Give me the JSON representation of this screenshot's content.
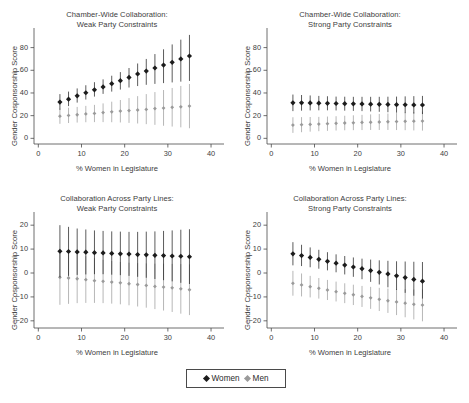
{
  "figure": {
    "background": "#ffffff",
    "width": 469,
    "height": 403
  },
  "legend": {
    "entries": [
      {
        "label": "Women",
        "marker": "diamond-marker",
        "color": "#1c1c1c"
      },
      {
        "label": "Men",
        "marker": "diamond-marker",
        "color": "#9a9a9a"
      }
    ]
  },
  "chart_data": [
    {
      "id": "chamber-wide-weak",
      "type": "scatter",
      "title": "Chamber-Wide Collaboration:\nWeak Party Constraints",
      "xlabel": "% Women in Legislature",
      "ylabel": "Gender Cosponsorship Score",
      "xlim": [
        -1,
        43
      ],
      "ylim": [
        -5,
        92
      ],
      "xticks": [
        0,
        10,
        20,
        30,
        40
      ],
      "yticks": [
        0,
        20,
        40,
        60,
        80
      ],
      "grid": false,
      "legend_position": "bottom-figure",
      "x": [
        5,
        7,
        9,
        11,
        13,
        15,
        17,
        19,
        21,
        23,
        25,
        27,
        29,
        31,
        33,
        35
      ],
      "series": [
        {
          "name": "Women",
          "color": "#1c1c1c",
          "marker": "diamond",
          "values": [
            32.0,
            34.5,
            37.5,
            40.2,
            42.8,
            45.3,
            48.2,
            50.8,
            53.7,
            56.8,
            59.3,
            62.0,
            64.6,
            67.0,
            70.0,
            72.6
          ],
          "ci_low": [
            25.2,
            28.4,
            31.5,
            34.2,
            36.8,
            39.2,
            41.2,
            43.0,
            44.8,
            46.1,
            47.2,
            48.0,
            48.7,
            49.3,
            50.0,
            50.6
          ],
          "ci_high": [
            39.0,
            41.2,
            44.0,
            46.8,
            49.5,
            52.0,
            55.2,
            58.4,
            62.0,
            66.0,
            70.0,
            74.3,
            78.5,
            82.8,
            87.0,
            91.2
          ]
        },
        {
          "name": "Men",
          "color": "#9a9a9a",
          "marker": "diamond",
          "values": [
            19.5,
            20.2,
            20.8,
            21.5,
            22.0,
            22.7,
            23.4,
            24.0,
            24.5,
            25.0,
            25.5,
            26.2,
            26.7,
            27.3,
            27.8,
            28.4
          ],
          "ci_low": [
            12.8,
            13.5,
            13.9,
            14.2,
            14.3,
            14.3,
            14.2,
            14.0,
            13.6,
            13.1,
            12.5,
            11.9,
            11.1,
            10.4,
            9.7,
            8.9
          ],
          "ci_high": [
            26.2,
            27.0,
            27.7,
            28.6,
            29.5,
            30.8,
            32.3,
            33.8,
            35.5,
            37.2,
            39.0,
            40.8,
            42.6,
            44.4,
            46.2,
            47.9
          ]
        }
      ]
    },
    {
      "id": "chamber-wide-strong",
      "type": "scatter",
      "title": "Chamber-Wide Collaboration:\nStrong Party Constraints",
      "xlabel": "% Women in Legislature",
      "ylabel": "Gender Cosponsorship Score",
      "xlim": [
        -1,
        43
      ],
      "ylim": [
        -5,
        92
      ],
      "xticks": [
        0,
        10,
        20,
        30,
        40
      ],
      "yticks": [
        0,
        20,
        40,
        60,
        80
      ],
      "grid": false,
      "legend_position": "bottom-figure",
      "x": [
        5,
        7,
        9,
        11,
        13,
        15,
        17,
        19,
        21,
        23,
        25,
        27,
        29,
        31,
        33,
        35
      ],
      "series": [
        {
          "name": "Women",
          "color": "#1c1c1c",
          "marker": "diamond",
          "values": [
            31.3,
            31.3,
            31.2,
            31.0,
            30.9,
            30.7,
            30.6,
            30.4,
            30.3,
            30.1,
            30.0,
            29.9,
            29.7,
            29.6,
            29.5,
            29.4
          ],
          "ci_low": [
            24.0,
            24.4,
            24.6,
            24.7,
            24.7,
            24.6,
            24.4,
            24.2,
            24.0,
            23.7,
            23.4,
            23.0,
            22.6,
            22.2,
            21.8,
            21.4
          ],
          "ci_high": [
            38.6,
            38.2,
            37.8,
            37.4,
            37.1,
            36.8,
            36.7,
            36.6,
            36.6,
            36.6,
            36.6,
            36.7,
            36.8,
            37.0,
            37.2,
            37.4
          ]
        },
        {
          "name": "Men",
          "color": "#9a9a9a",
          "marker": "diamond",
          "values": [
            11.7,
            12.0,
            12.3,
            12.6,
            12.9,
            13.2,
            13.5,
            13.7,
            14.0,
            14.2,
            14.4,
            14.6,
            14.8,
            15.0,
            15.1,
            15.2
          ],
          "ci_low": [
            4.8,
            5.4,
            5.9,
            6.3,
            6.6,
            6.9,
            7.1,
            7.2,
            7.3,
            7.4,
            7.4,
            7.4,
            7.3,
            7.2,
            7.0,
            6.8
          ],
          "ci_high": [
            18.6,
            18.7,
            18.8,
            18.9,
            19.2,
            19.5,
            19.9,
            20.3,
            20.7,
            21.1,
            21.5,
            21.9,
            22.3,
            22.8,
            23.2,
            23.6
          ]
        }
      ]
    },
    {
      "id": "across-party-weak",
      "type": "scatter",
      "title": "Collaboration Across Party Lines:\nWeak Party Constraints",
      "xlabel": "% Women in Legislature",
      "ylabel": "Gender Cosponsorship Score",
      "xlim": [
        -1,
        43
      ],
      "ylim": [
        -23,
        23
      ],
      "xticks": [
        0,
        10,
        20,
        30,
        40
      ],
      "yticks": [
        -20,
        -10,
        0,
        10,
        20
      ],
      "grid": false,
      "legend_position": "bottom-figure",
      "x": [
        5,
        7,
        9,
        11,
        13,
        15,
        17,
        19,
        21,
        23,
        25,
        27,
        29,
        31,
        33,
        35
      ],
      "series": [
        {
          "name": "Women",
          "color": "#1c1c1c",
          "marker": "diamond",
          "values": [
            9.1,
            9.0,
            8.8,
            8.7,
            8.5,
            8.4,
            8.2,
            8.0,
            7.9,
            7.7,
            7.6,
            7.4,
            7.3,
            7.1,
            7.0,
            6.8
          ],
          "ci_low": [
            -1.8,
            -1.2,
            -0.8,
            -0.6,
            -0.5,
            -0.5,
            -0.7,
            -0.9,
            -1.2,
            -1.6,
            -2.0,
            -2.5,
            -3.0,
            -3.5,
            -4.1,
            -4.6
          ],
          "ci_high": [
            20.0,
            19.3,
            18.6,
            18.2,
            17.8,
            17.6,
            17.4,
            17.3,
            17.2,
            17.2,
            17.3,
            17.4,
            17.6,
            17.8,
            18.1,
            18.3
          ]
        },
        {
          "name": "Men",
          "color": "#9a9a9a",
          "marker": "diamond",
          "values": [
            -1.8,
            -2.1,
            -2.4,
            -2.8,
            -3.2,
            -3.5,
            -3.8,
            -4.1,
            -4.5,
            -4.8,
            -5.2,
            -5.6,
            -5.9,
            -6.2,
            -6.6,
            -7.0
          ],
          "ci_low": [
            -13.3,
            -12.9,
            -12.6,
            -12.5,
            -12.5,
            -12.6,
            -12.8,
            -13.1,
            -13.5,
            -14.0,
            -14.5,
            -15.1,
            -15.7,
            -16.3,
            -17.0,
            -17.6
          ],
          "ci_high": [
            9.6,
            8.7,
            7.8,
            7.0,
            6.2,
            5.5,
            5.0,
            4.6,
            4.3,
            4.1,
            4.0,
            3.9,
            3.9,
            3.8,
            3.7,
            3.6
          ]
        }
      ]
    },
    {
      "id": "across-party-strong",
      "type": "scatter",
      "title": "Collaboration Across Party Lines:\nStrong Party Constraints",
      "xlabel": "% Women in Legislature",
      "ylabel": "Gender Cosponsorship Score",
      "xlim": [
        -1,
        43
      ],
      "ylim": [
        -23,
        23
      ],
      "xticks": [
        0,
        10,
        20,
        30,
        40
      ],
      "yticks": [
        -20,
        -10,
        0,
        10,
        20
      ],
      "grid": false,
      "legend_position": "bottom-figure",
      "x": [
        5,
        7,
        9,
        11,
        13,
        15,
        17,
        19,
        21,
        23,
        25,
        27,
        29,
        31,
        33,
        35
      ],
      "series": [
        {
          "name": "Women",
          "color": "#1c1c1c",
          "marker": "diamond",
          "values": [
            8.0,
            7.3,
            6.5,
            5.7,
            4.9,
            4.1,
            3.3,
            2.5,
            1.8,
            1.0,
            0.3,
            -0.4,
            -1.2,
            -1.9,
            -2.7,
            -3.4
          ],
          "ci_low": [
            3.2,
            2.9,
            2.4,
            1.8,
            1.1,
            0.3,
            -0.6,
            -1.6,
            -2.6,
            -3.7,
            -4.8,
            -6.0,
            -7.1,
            -8.3,
            -9.5,
            -10.7
          ],
          "ci_high": [
            12.9,
            11.8,
            10.7,
            9.7,
            8.7,
            7.8,
            7.1,
            6.5,
            6.0,
            5.6,
            5.3,
            5.1,
            4.9,
            4.8,
            4.7,
            4.6
          ]
        },
        {
          "name": "Men",
          "color": "#9a9a9a",
          "marker": "diamond",
          "values": [
            -4.3,
            -5.0,
            -5.7,
            -6.4,
            -7.1,
            -7.8,
            -8.5,
            -9.1,
            -9.8,
            -10.4,
            -11.0,
            -11.6,
            -12.1,
            -12.6,
            -13.1,
            -13.4
          ],
          "ci_low": [
            -9.5,
            -9.8,
            -10.2,
            -10.7,
            -11.3,
            -11.9,
            -12.6,
            -13.4,
            -14.2,
            -15.0,
            -15.9,
            -16.7,
            -17.6,
            -18.5,
            -19.4,
            -20.2
          ],
          "ci_high": [
            0.9,
            -0.2,
            -1.2,
            -2.1,
            -2.9,
            -3.6,
            -4.3,
            -4.9,
            -5.4,
            -5.8,
            -6.2,
            -6.5,
            -6.7,
            -6.8,
            -6.9,
            -6.9
          ]
        }
      ]
    }
  ]
}
